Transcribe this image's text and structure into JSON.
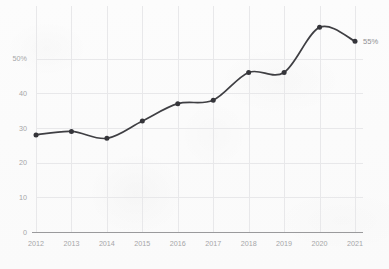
{
  "chart_data": {
    "type": "line",
    "title": "",
    "subtitle": "",
    "xlabel": "",
    "ylabel": "",
    "categories": [
      "2012",
      "2013",
      "2014",
      "2015",
      "2016",
      "2017",
      "2018",
      "2019",
      "2020",
      "2021"
    ],
    "values": [
      28,
      29,
      27,
      32,
      37,
      38,
      46,
      46,
      59,
      55
    ],
    "series": [
      {
        "name": "",
        "values": [
          28,
          29,
          27,
          32,
          37,
          38,
          46,
          46,
          59,
          55
        ]
      }
    ],
    "ylim": [
      0,
      64
    ],
    "y_ticks": [
      0,
      10,
      20,
      30,
      40,
      50
    ],
    "y_tick_labels": [
      "0",
      "10",
      "20",
      "30",
      "40",
      "50%"
    ],
    "x_tick_labels": [
      "2012",
      "2013",
      "2014",
      "2015",
      "2016",
      "2017",
      "2018",
      "2019",
      "2020",
      "2021"
    ],
    "grid": {
      "horizontal": true,
      "vertical": true
    },
    "legend": {
      "visible": false,
      "position": "none"
    },
    "annotations": [
      {
        "name": "last-point-value",
        "text": "55%",
        "x": "2021",
        "y": 55
      }
    ],
    "colors": {
      "line": "#3f3f43",
      "marker": "#35353a",
      "grid": "#e8e8ea",
      "axis": "#9a9a9c",
      "tick_text": "#a6a6a8",
      "label_text": "#8f8f92",
      "background": "#fbfbfb"
    },
    "marker": {
      "shape": "circle",
      "radius": 2.5
    }
  }
}
